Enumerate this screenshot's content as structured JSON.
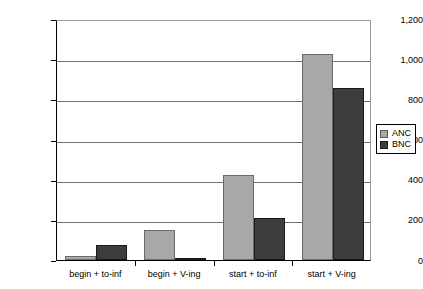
{
  "chart_data": {
    "type": "bar",
    "title": "",
    "subtitle": "",
    "xlabel": "",
    "ylabel": "",
    "categories": [
      "begin + to-inf",
      "begin + V-ing",
      "start + to-inf",
      "start + V-ing"
    ],
    "series": [
      {
        "name": "ANC",
        "color": "#a8a8a8",
        "values": [
          20,
          150,
          425,
          1025
        ]
      },
      {
        "name": "BNC",
        "color": "#3d3d3d",
        "values": [
          75,
          10,
          210,
          855
        ]
      }
    ],
    "ylim": [
      0,
      1200
    ],
    "ytick_values": [
      0,
      200,
      400,
      600,
      800,
      1000,
      1200
    ],
    "ytick_labels": [
      "0",
      "200",
      "400",
      "600",
      "800",
      "1,000",
      "1,200"
    ],
    "grid": true,
    "grid_axis": "y",
    "legend": {
      "position": "right",
      "entries": [
        {
          "label": "ANC",
          "color": "#a8a8a8"
        },
        {
          "label": "BNC",
          "color": "#3d3d3d"
        }
      ]
    }
  }
}
